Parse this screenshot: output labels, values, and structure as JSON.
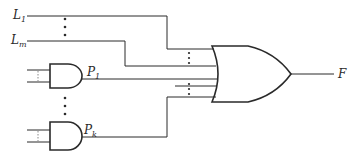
{
  "diagram": {
    "type": "logic-circuit",
    "labels": {
      "L1": {
        "base": "L",
        "sub": "1"
      },
      "Lm": {
        "base": "L",
        "sub": "m"
      },
      "P1": {
        "base": "P",
        "sub": "1"
      },
      "Pk": {
        "base": "P",
        "sub": "k"
      },
      "F": {
        "base": "F",
        "sub": ""
      }
    },
    "gates": [
      {
        "id": "and-p1",
        "kind": "AND",
        "output": "P1"
      },
      {
        "id": "and-pk",
        "kind": "AND",
        "output": "Pk"
      },
      {
        "id": "or-main",
        "kind": "OR",
        "output": "F"
      }
    ],
    "ellipsis": "⋮",
    "colors": {
      "stroke": "#2a2a2a",
      "background": "#ffffff"
    }
  }
}
